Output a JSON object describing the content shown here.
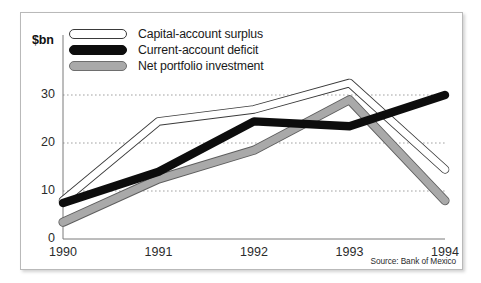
{
  "figure": {
    "unit_label": "$bn",
    "source": "Source: Bank of Mexico"
  },
  "legend": {
    "items": [
      {
        "label": "Capital-account surplus",
        "style": "white-outline",
        "color": "#ffffff"
      },
      {
        "label": "Current-account deficit",
        "style": "solid-black",
        "color": "#0d0d0d"
      },
      {
        "label": "Net portfolio investment",
        "style": "solid-gray",
        "color": "#a9a9a9"
      }
    ]
  },
  "chart_data": {
    "type": "line",
    "title": "",
    "subtitle": "",
    "xlabel": "",
    "ylabel": "$bn",
    "categories": [
      "1990",
      "1991",
      "1992",
      "1993",
      "1994"
    ],
    "x": [
      1990,
      1991,
      1992,
      1993,
      1994
    ],
    "ylim": [
      0,
      35
    ],
    "yticks": [
      0,
      10,
      20,
      30
    ],
    "ytick_labels": [
      "0",
      "10",
      "20",
      "30"
    ],
    "xtick_labels": [
      "1990",
      "1991",
      "1992",
      "1993",
      "1994"
    ],
    "grid": "horizontal-dotted",
    "legend_position": "top-left",
    "annotations": [
      "Source: Bank of Mexico"
    ],
    "series": [
      {
        "name": "Capital-account surplus",
        "color": "#ffffff",
        "line_style": "white-fill-dark-outline",
        "values": [
          8,
          24.5,
          27,
          32.5,
          14.5
        ]
      },
      {
        "name": "Current-account deficit",
        "color": "#0d0d0d",
        "line_style": "thick-solid-black",
        "values": [
          7.5,
          14,
          24.5,
          23.5,
          30
        ]
      },
      {
        "name": "Net portfolio investment",
        "color": "#a9a9a9",
        "line_style": "thick-gray-outline",
        "values": [
          3.5,
          12.5,
          18.5,
          29,
          8
        ]
      }
    ]
  }
}
